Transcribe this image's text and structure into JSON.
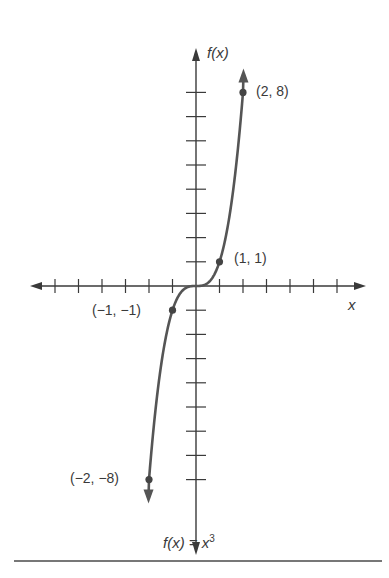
{
  "chart_data": {
    "type": "line",
    "title": "",
    "function": "f(x) = x^3",
    "xlabel": "x",
    "ylabel": "f(x)",
    "caption": "f(x) = x³",
    "xlim": [
      -6,
      6
    ],
    "ylim": [
      -8,
      8
    ],
    "x_ticks": [
      -6,
      -5,
      -4,
      -3,
      -2,
      -1,
      1,
      2,
      3,
      4,
      5,
      6
    ],
    "y_ticks": [
      -8,
      -7,
      -6,
      -5,
      -4,
      -3,
      -2,
      -1,
      1,
      2,
      3,
      4,
      5,
      6,
      7,
      8
    ],
    "grid": false,
    "points": [
      {
        "x": -2,
        "y": -8,
        "label": "(−2, −8)"
      },
      {
        "x": -1,
        "y": -1,
        "label": "(−1, −1)"
      },
      {
        "x": 1,
        "y": 1,
        "label": "(1, 1)"
      },
      {
        "x": 2,
        "y": 8,
        "label": "(2, 8)"
      }
    ],
    "series": [
      {
        "name": "f(x) = x^3",
        "x_range": [
          -2.1,
          2.1
        ]
      }
    ]
  },
  "labels": {
    "y_axis": "f(x)",
    "x_axis": "x",
    "p_2_8": "(2, 8)",
    "p_1_1": "(1, 1)",
    "p_m1_m1": "(−1, −1)",
    "p_m2_m8": "(−2, −8)",
    "caption_base": "f(x) = x",
    "caption_exp": "3"
  },
  "colors": {
    "axis": "#3a3a3a",
    "curve": "#555555",
    "text": "#3a3a3a"
  }
}
